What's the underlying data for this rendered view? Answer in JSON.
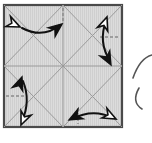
{
  "figure": {
    "title": "Origami crease pattern square with fold-direction arrows",
    "kind": "origami-diagram",
    "canvas": {
      "width": 152,
      "height": 143,
      "background": "#ffffff"
    },
    "sheet": {
      "name": "paper-square",
      "x": 4,
      "y": 5,
      "width": 118,
      "height": 122,
      "fill": "#dcdcdc",
      "border_color": "#4a4a4a",
      "border_width": 2.2,
      "hatch": {
        "enabled": true,
        "orientation": "vertical",
        "spacing": 2,
        "color": "#c9c9c9",
        "width": 1
      }
    },
    "crease_color": "#9a9a9a",
    "crease_width": 1,
    "creases": [
      {
        "name": "crease-diagonal-tl-br",
        "type": "solid",
        "x1": 4,
        "y1": 5,
        "x2": 122,
        "y2": 127
      },
      {
        "name": "crease-diagonal-bl-tr",
        "type": "solid",
        "x1": 4,
        "y1": 127,
        "x2": 122,
        "y2": 5
      },
      {
        "name": "crease-midline-horizontal",
        "type": "solid",
        "x1": 4,
        "y1": 66,
        "x2": 122,
        "y2": 66
      },
      {
        "name": "crease-midline-vertical",
        "type": "solid",
        "x1": 63,
        "y1": 5,
        "x2": 63,
        "y2": 127
      },
      {
        "name": "crease-diamond-top-left",
        "type": "solid",
        "x1": 63,
        "y1": 5,
        "x2": 4,
        "y2": 66
      },
      {
        "name": "crease-diamond-top-right",
        "type": "solid",
        "x1": 63,
        "y1": 5,
        "x2": 122,
        "y2": 66
      },
      {
        "name": "crease-diamond-bottom-left",
        "type": "solid",
        "x1": 4,
        "y1": 66,
        "x2": 63,
        "y2": 127
      },
      {
        "name": "crease-diamond-bottom-right",
        "type": "solid",
        "x1": 63,
        "y1": 127,
        "x2": 122,
        "y2": 66
      }
    ],
    "dashed_marks": [
      {
        "name": "dash-tick-top-center",
        "x1": 63,
        "y1": 8,
        "x2": 63,
        "y2": 22,
        "color": "#8a8a8a",
        "width": 1.4,
        "dash": "3 2"
      },
      {
        "name": "dash-tick-right-upper",
        "x1": 100,
        "y1": 37,
        "x2": 119,
        "y2": 37,
        "color": "#8a8a8a",
        "width": 1.4,
        "dash": "3 2"
      },
      {
        "name": "dash-tick-left-lower",
        "x1": 6,
        "y1": 96,
        "x2": 25,
        "y2": 96,
        "color": "#8a8a8a",
        "width": 1.4,
        "dash": "3 2"
      },
      {
        "name": "dash-tick-bottom-center",
        "x1": 78,
        "y1": 108,
        "x2": 78,
        "y2": 124,
        "color": "#8a8a8a",
        "width": 1.4,
        "dash": "3 2"
      }
    ],
    "arrows": {
      "stroke_color": "#111111",
      "stroke_width": 2,
      "solid_head_fill": "#111111",
      "hollow_head_fill": "#ffffff",
      "items": [
        {
          "name": "arrow-top-left",
          "orientation": "horizontal-arc",
          "description": "curved double-headed arrow, hollow head left, solid head right",
          "path": "M 20 27 Q 43 39 62 24",
          "head_start": {
            "style": "hollow",
            "x": 20,
            "y": 27,
            "angle": 205
          },
          "head_end": {
            "style": "solid",
            "x": 62,
            "y": 24,
            "angle": -38
          }
        },
        {
          "name": "arrow-top-right",
          "orientation": "vertical-arc",
          "description": "curved double-headed arrow, hollow head up, solid head down",
          "path": "M 107 18 Q 98 42 111 64",
          "head_start": {
            "style": "hollow",
            "x": 107,
            "y": 18,
            "angle": -110
          },
          "head_end": {
            "style": "solid",
            "x": 111,
            "y": 64,
            "angle": 62
          }
        },
        {
          "name": "arrow-bottom-left",
          "orientation": "vertical-arc",
          "description": "curved double-headed arrow, solid head up, hollow head down",
          "path": "M 22 78 Q 31 101 21 124",
          "head_start": {
            "style": "solid",
            "x": 22,
            "y": 78,
            "angle": -110
          },
          "head_end": {
            "style": "hollow",
            "x": 21,
            "y": 124,
            "angle": 113
          }
        },
        {
          "name": "arrow-bottom-right",
          "orientation": "horizontal-arc",
          "description": "curved double-headed arrow, solid head left, hollow head right",
          "path": "M 70 120 Q 93 108 115 119",
          "head_start": {
            "style": "solid",
            "x": 70,
            "y": 120,
            "angle": 152
          },
          "head_end": {
            "style": "hollow",
            "x": 115,
            "y": 119,
            "angle": 27
          }
        }
      ]
    },
    "edge_marks": [
      {
        "name": "clipped-stroke-upper-right",
        "description": "partial curved stroke clipped at right edge of figure",
        "path": "M 133 78 Q 140 58 152 55",
        "color": "#555555",
        "width": 1.6
      },
      {
        "name": "clipped-stroke-lower-right",
        "description": "partial curved hook clipped at right edge of figure",
        "path": "M 139 88 Q 131 102 142 109",
        "color": "#555555",
        "width": 1.6
      }
    ]
  }
}
